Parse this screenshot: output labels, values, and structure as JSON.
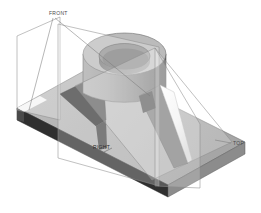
{
  "drawing": {
    "title": "Isometric CAD model with cutting planes",
    "background_color": "#ffffff",
    "view": "isometric"
  },
  "labels": {
    "front": "FRONT",
    "top": "TOP",
    "side": "RIGHT"
  },
  "colors": {
    "base_top": "#b4b4b4",
    "base_front_dark": "#2e2e2e",
    "base_right_mid": "#8e8e8e",
    "base_edge_light": "#f2f2f2",
    "cylinder_top_annulus": "#b9b9b9",
    "cylinder_bore_wall": "#8b8b8b",
    "cylinder_bore_floor": "#787878",
    "cylinder_side_left": "#9c9c9c",
    "cylinder_side_right": "#6e6e6e",
    "rib_left_dark": "#3a3a3a",
    "rib_right_light": "#fbfbfb",
    "rib_right_shadow": "#6a6a6a",
    "plane_fill": "rgba(255,255,255,0.38)",
    "plane_stroke": "#8d8d8d",
    "leader_stroke": "#7a7a7a",
    "outline": "#5a5a5a",
    "label_text": "#4a4a4a"
  },
  "geometry": {
    "base_plate": {
      "name": "rectangular base plate",
      "thickness_px": 14
    },
    "boss": {
      "name": "cylindrical boss with through bore",
      "feature": "counterbore"
    },
    "ribs": [
      {
        "name": "left-gusset",
        "shading": "dark"
      },
      {
        "name": "right-gusset",
        "shading": "highlight"
      }
    ]
  },
  "cutting_planes": [
    {
      "id": "frontal",
      "label": "FRONT"
    },
    {
      "id": "horizontal",
      "label": "TOP"
    },
    {
      "id": "profile",
      "label": "RIGHT"
    }
  ]
}
